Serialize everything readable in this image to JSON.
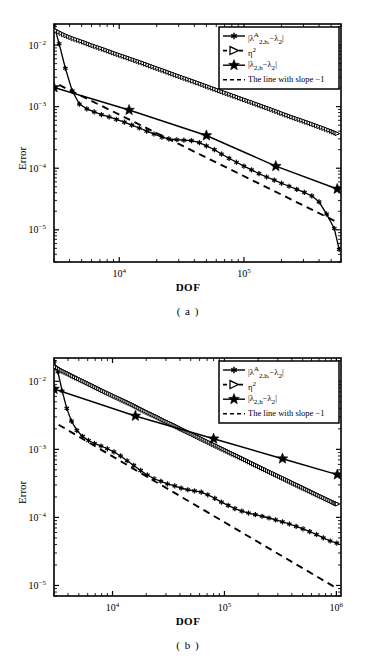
{
  "figure": {
    "panels": [
      {
        "id": "a",
        "caption": "( a )",
        "chart_data": {
          "type": "line",
          "title": "",
          "xlabel": "DOF",
          "ylabel": "Error",
          "xscale": "log",
          "yscale": "log",
          "xlim": [
            3000,
            600000
          ],
          "ylim": [
            3e-06,
            0.022
          ],
          "xticks": [
            10000,
            100000
          ],
          "xticklabels": [
            "10^4",
            "10^5"
          ],
          "yticks": [
            0.01,
            0.001,
            0.0001,
            1e-05
          ],
          "yticklabels": [
            "10^-2",
            "10^-3",
            "10^-4",
            "10^-5"
          ],
          "grid": false,
          "legend_position": "upper-right",
          "series": [
            {
              "name": "|λ^A_{2,h_i}-λ_2|",
              "marker": "asterisk",
              "linestyle": "solid",
              "x": [
                3000,
                3300,
                3700,
                4200,
                4800,
                5500,
                6300,
                7200,
                8300,
                9500,
                11000,
                12600,
                14500,
                16600,
                19000,
                22000,
                25000,
                29000,
                33000,
                38000,
                44000,
                50000,
                58000,
                66000,
                76000,
                87000,
                100000,
                115000,
                132000,
                152000,
                175000,
                200000,
                230000,
                265000,
                305000,
                350000,
                400000,
                460000,
                530000,
                580000
              ],
              "y": [
                0.021,
                0.0105,
                0.0042,
                0.0018,
                0.0011,
                0.00092,
                0.00082,
                0.00074,
                0.00068,
                0.00062,
                0.00056,
                0.0005,
                0.00045,
                0.0004,
                0.00036,
                0.00032,
                0.0003,
                0.00029,
                0.000285,
                0.00028,
                0.00026,
                0.00023,
                0.0002,
                0.00017,
                0.000145,
                0.000125,
                0.000108,
                9.4e-05,
                8.2e-05,
                7.2e-05,
                6.4e-05,
                5.7e-05,
                5.1e-05,
                4.55e-05,
                4.05e-05,
                3.55e-05,
                2.85e-05,
                1.8e-05,
                1.05e-05,
                4.8e-06
              ]
            },
            {
              "name": "η^2",
              "marker": "triangle-right",
              "linestyle": "dashed-dense",
              "x": [
                3000,
                3600,
                4300,
                5200,
                6200,
                7500,
                9000,
                10800,
                13000,
                15600,
                18700,
                22500,
                27000,
                32400,
                39000,
                47000,
                56000,
                67000,
                81000,
                97000,
                117000,
                140000,
                168000,
                202000,
                243000,
                292000,
                350000,
                420000,
                505000,
                580000
              ],
              "y": [
                0.018,
                0.0148,
                0.0128,
                0.0112,
                0.0098,
                0.0086,
                0.0075,
                0.0066,
                0.0058,
                0.0051,
                0.00445,
                0.0039,
                0.0034,
                0.00298,
                0.00261,
                0.00228,
                0.002,
                0.00175,
                0.00153,
                0.00134,
                0.00117,
                0.001025,
                0.0009,
                0.00078,
                0.00068,
                0.0006,
                0.000525,
                0.00046,
                0.0004,
                0.000355
              ]
            },
            {
              "name": "|λ_{2,h}-λ_2|",
              "marker": "star",
              "linestyle": "solid",
              "x": [
                3000,
                12000,
                50000,
                180000,
                560000
              ],
              "y": [
                0.00205,
                0.00088,
                0.00034,
                0.000108,
                4.6e-05
              ]
            },
            {
              "name": "The line with slope −1",
              "marker": "none",
              "linestyle": "dashed",
              "x": [
                3300,
                560000
              ],
              "y": [
                0.00225,
                1.33e-05
              ]
            }
          ]
        }
      },
      {
        "id": "b",
        "caption": "( b )",
        "chart_data": {
          "type": "line",
          "title": "",
          "xlabel": "DOF",
          "ylabel": "Error",
          "xscale": "log",
          "yscale": "log",
          "xlim": [
            3000,
            1100000
          ],
          "ylim": [
            7e-06,
            0.022
          ],
          "xticks": [
            10000,
            100000,
            1000000
          ],
          "xticklabels": [
            "10^4",
            "10^5",
            "10^6"
          ],
          "yticks": [
            0.01,
            0.001,
            0.0001,
            1e-05
          ],
          "yticklabels": [
            "10^-2",
            "10^-3",
            "10^-4",
            "10^-5"
          ],
          "grid": false,
          "legend_position": "upper-right",
          "series": [
            {
              "name": "|λ^A_{2,h_i}-λ_2|",
              "marker": "asterisk",
              "linestyle": "solid",
              "x": [
                3000,
                3250,
                3550,
                3900,
                4300,
                4800,
                5400,
                6100,
                6900,
                7900,
                9000,
                10300,
                11800,
                13500,
                15500,
                17800,
                20500,
                23500,
                27000,
                31000,
                36000,
                41000,
                47000,
                54000,
                62000,
                71000,
                82000,
                94000,
                108000,
                124000,
                143000,
                164000,
                189000,
                217000,
                250000,
                287000,
                330000,
                380000,
                437000,
                503000,
                578000,
                665000,
                765000,
                880000,
                1010000
              ],
              "y": [
                0.0195,
                0.0138,
                0.0072,
                0.004,
                0.0026,
                0.0019,
                0.00155,
                0.00135,
                0.00122,
                0.00112,
                0.00102,
                0.00092,
                0.0008,
                0.00068,
                0.00058,
                0.00049,
                0.00042,
                0.00037,
                0.00034,
                0.00031,
                0.00029,
                0.00027,
                0.000255,
                0.000245,
                0.000235,
                0.000215,
                0.00019,
                0.000168,
                0.00015,
                0.000135,
                0.000124,
                0.000116,
                0.00011,
                0.000104,
                9.8e-05,
                9.2e-05,
                8.6e-05,
                8e-05,
                7.4e-05,
                6.8e-05,
                6.2e-05,
                5.6e-05,
                5e-05,
                4.5e-05,
                4.2e-05
              ]
            },
            {
              "name": "η^2",
              "marker": "triangle-right",
              "linestyle": "dashed-dense",
              "x": [
                3000,
                3500,
                4100,
                4800,
                5700,
                6700,
                7900,
                9300,
                11000,
                13000,
                15300,
                18000,
                21300,
                25100,
                29600,
                35000,
                41200,
                48600,
                57400,
                67700,
                80000,
                94000,
                111000,
                131000,
                155000,
                183000,
                216000,
                254000,
                300000,
                354000,
                418000,
                493000,
                582000,
                686000,
                810000,
                956000,
                1050000
              ],
              "y": [
                0.017,
                0.0145,
                0.0128,
                0.0112,
                0.0098,
                0.0086,
                0.0075,
                0.0066,
                0.0058,
                0.0051,
                0.0045,
                0.0039,
                0.0034,
                0.003,
                0.0026,
                0.0023,
                0.002,
                0.00176,
                0.00154,
                0.00135,
                0.00118,
                0.00104,
                0.00091,
                0.0008,
                0.0007,
                0.00061,
                0.000535,
                0.00047,
                0.000412,
                0.000362,
                0.000317,
                0.000278,
                0.000244,
                0.000214,
                0.000188,
                0.000165,
                0.000155
              ]
            },
            {
              "name": "|λ_{2,h}-λ_2|",
              "marker": "star",
              "linestyle": "solid",
              "x": [
                3000,
                16000,
                80000,
                330000,
                1020000
              ],
              "y": [
                0.0077,
                0.0031,
                0.00143,
                0.00073,
                0.000425
              ]
            },
            {
              "name": "The line with slope −1",
              "marker": "none",
              "linestyle": "dashed",
              "x": [
                3300,
                1020000
              ],
              "y": [
                0.0023,
                9e-06
              ]
            }
          ]
        }
      }
    ],
    "legend": {
      "entries": [
        {
          "label_html": "|λ<sup>A</sup><sub>2,h<sub>i</sub></sub>−λ<sub>2</sub>|",
          "marker": "asterisk",
          "line": "solid"
        },
        {
          "label_html": "η<sup>2</sup>",
          "marker": "triangle-right",
          "line": "dashed"
        },
        {
          "label_html": "|λ<sub>2,h</sub>−λ<sub>2</sub>|",
          "marker": "star",
          "line": "solid"
        },
        {
          "label_html": "The line with slope −1",
          "marker": "none",
          "line": "dashed"
        }
      ]
    },
    "colors": {
      "foreground": "#000000",
      "background": "#ffffff"
    }
  }
}
